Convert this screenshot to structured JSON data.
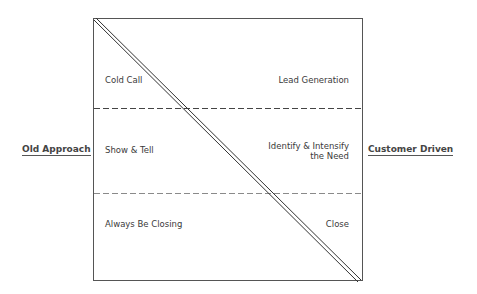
{
  "side_labels": {
    "left": "Old Approach",
    "right": "Customer Driven"
  },
  "rows": [
    {
      "left": "Cold Call",
      "right": "Lead Generation"
    },
    {
      "left": "Show & Tell",
      "right_line1": "Identify & Intensify",
      "right_line2": "the Need"
    },
    {
      "left": "Always Be Closing",
      "right": "Close"
    }
  ],
  "colors": {
    "frame": "#555555",
    "divider_top": "#444444",
    "divider_bottom": "#8a8a8a"
  }
}
